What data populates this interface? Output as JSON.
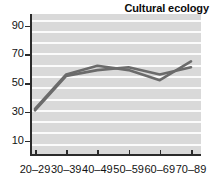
{
  "chart_data": {
    "type": "line",
    "title": "Cultural ecology",
    "xlabel": "",
    "ylabel": "",
    "categories": [
      "20–29",
      "30–39",
      "40–49",
      "50–59",
      "60–69",
      "70–89"
    ],
    "series": [
      {
        "name": "series-1",
        "values": [
          32,
          56,
          62,
          59,
          52,
          65
        ],
        "color": "#6b6b6b"
      },
      {
        "name": "series-2",
        "values": [
          31,
          55,
          59,
          61,
          56,
          61
        ],
        "color": "#6b6b6b"
      }
    ],
    "ylim": [
      0,
      98
    ],
    "yticks": [
      10,
      30,
      50,
      70,
      90
    ],
    "ytick_labels": [
      "10",
      "30",
      "50",
      "70",
      "90"
    ],
    "gridlines": {
      "visible": true,
      "color": "#fbfbfb",
      "orientation": "horizontal",
      "count": 12
    },
    "grid": true,
    "legend": null,
    "legend_position": "none",
    "plot_background": "#d9d9d9",
    "figure_background": "#ffffff",
    "axis_color": "#2b2b2b"
  }
}
